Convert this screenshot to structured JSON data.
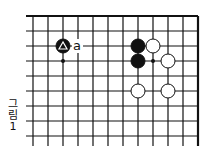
{
  "diagram": {
    "caption": [
      "그",
      "림",
      "1"
    ],
    "grid": {
      "origin_x": 33,
      "origin_y": 16,
      "spacing": 15,
      "cols": 12,
      "rows": 9,
      "left_extension_x": 26,
      "bottom_extension_y": 146,
      "top_edge": true,
      "right_edge": true
    },
    "stones": [
      {
        "color": "black",
        "col": 2,
        "row": 2,
        "marker": "triangle"
      },
      {
        "color": "black",
        "col": 7,
        "row": 2
      },
      {
        "color": "black",
        "col": 7,
        "row": 3
      },
      {
        "color": "white",
        "col": 8,
        "row": 2
      },
      {
        "color": "white",
        "col": 9,
        "row": 3
      },
      {
        "color": "white",
        "col": 7,
        "row": 5
      },
      {
        "color": "white",
        "col": 9,
        "row": 5
      }
    ],
    "points": [
      {
        "col": 2,
        "row": 3
      },
      {
        "col": 8,
        "row": 3
      }
    ],
    "labels": [
      {
        "text": "a",
        "col": 3,
        "row": 2
      }
    ]
  }
}
